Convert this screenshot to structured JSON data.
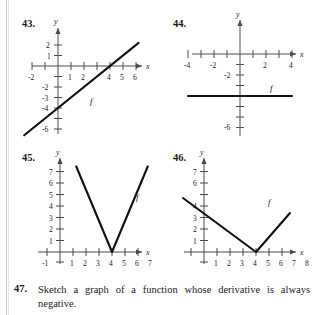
{
  "page": {
    "background_color": "#ffffff",
    "ink_color": "#111111",
    "axis_color": "#4a4a4a"
  },
  "exercises": [
    {
      "number": "43.",
      "graph": {
        "type": "line",
        "y_axis_label": "y",
        "x_axis_label": "x",
        "x_tick_labels": [
          "-2",
          "1",
          "2",
          "4",
          "5",
          "6"
        ],
        "y_tick_labels": [
          "2",
          "1",
          "-2",
          "-3",
          "-4",
          "-6"
        ],
        "curve_label": "f",
        "description": "Straight line of slope 1 through (0,-4) and (4,0)",
        "slope": 1,
        "y_intercept": -4,
        "x_intercept": 4
      }
    },
    {
      "number": "44.",
      "graph": {
        "type": "line",
        "y_axis_label": "y",
        "x_axis_label": "x",
        "x_tick_labels": [
          "-4",
          "-2",
          "2",
          "4"
        ],
        "y_tick_labels": [
          "-2",
          "-6"
        ],
        "curve_label": "f",
        "description": "Horizontal line at y = -4",
        "slope": 0,
        "y_intercept": -4
      }
    },
    {
      "number": "45.",
      "graph": {
        "type": "parabola",
        "y_axis_label": "y",
        "x_axis_label": "x",
        "x_tick_labels": [
          "-1",
          "1",
          "2",
          "3",
          "4",
          "5",
          "6",
          "7"
        ],
        "y_tick_labels": [
          "7",
          "6",
          "5",
          "4",
          "3",
          "2",
          "1"
        ],
        "curve_label": "f",
        "description": "Upward parabola with vertex at (4,0)",
        "vertex": [
          4,
          0
        ]
      }
    },
    {
      "number": "46.",
      "graph": {
        "type": "absolute-value",
        "y_axis_label": "y",
        "x_axis_label": "x",
        "x_tick_labels": [
          "1",
          "2",
          "3",
          "4",
          "5",
          "6",
          "7",
          "8"
        ],
        "y_tick_labels": [
          "7",
          "6",
          "4",
          "3",
          "2",
          "1"
        ],
        "curve_label": "f",
        "description": "V shape with vertex at (4,0), slopes -1 and +1",
        "vertex": [
          4,
          0
        ]
      }
    }
  ],
  "problem": {
    "number": "47.",
    "text": "Sketch a graph of a function whose derivative is always negative."
  }
}
